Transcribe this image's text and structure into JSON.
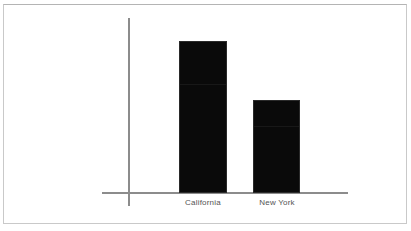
{
  "chart_data": {
    "type": "bar",
    "title": "",
    "subtitle": "",
    "xlabel": "",
    "ylabel": "",
    "categories": [
      "California",
      "New York"
    ],
    "values": [
      100,
      61
    ],
    "ylim": [
      0,
      124
    ],
    "grid": false,
    "legend": null,
    "legend_position": "none",
    "tick_labels_x": [
      "California",
      "New York"
    ],
    "tick_labels_y": [],
    "annotations": [],
    "series": [
      {
        "name": "",
        "values": [
          100,
          61
        ]
      }
    ]
  },
  "style": {
    "background_color": "#ffffff",
    "bar_color": "#0a0a0a",
    "axis_color": "#8c8c8c",
    "label_color": "#545454",
    "frame_color": "#c9c9c9"
  }
}
